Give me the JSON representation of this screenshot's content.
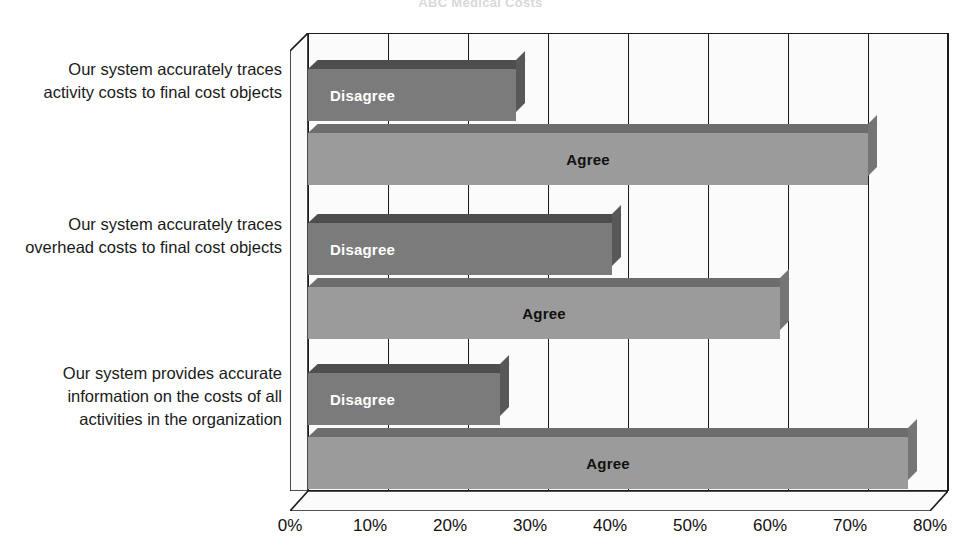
{
  "chart_data": {
    "type": "bar",
    "orientation": "horizontal",
    "title": "ABC Medical Costs",
    "xlabel": "",
    "ylabel": "",
    "xlim": [
      0,
      80
    ],
    "xticks": [
      "0%",
      "10%",
      "20%",
      "30%",
      "40%",
      "50%",
      "60%",
      "70%",
      "80%"
    ],
    "xtick_values": [
      0,
      10,
      20,
      30,
      40,
      50,
      60,
      70,
      80
    ],
    "grid": true,
    "legend": "inline-bar-labels",
    "categories": [
      "Our system accurately traces activity costs to final cost objects",
      "Our system accurately traces overhead costs to final cost objects",
      "Our system provides accurate information on the costs of all activities in the organization"
    ],
    "series": [
      {
        "name": "Disagree",
        "values": [
          26,
          38,
          24
        ],
        "color": "#7b7b7b"
      },
      {
        "name": "Agree",
        "values": [
          70,
          59,
          75
        ],
        "color": "#9b9b9b"
      }
    ]
  },
  "axis": {
    "ticks": [
      {
        "label": "0%",
        "value": 0
      },
      {
        "label": "10%",
        "value": 10
      },
      {
        "label": "20%",
        "value": 20
      },
      {
        "label": "30%",
        "value": 30
      },
      {
        "label": "40%",
        "value": 40
      },
      {
        "label": "50%",
        "value": 50
      },
      {
        "label": "60%",
        "value": 60
      },
      {
        "label": "70%",
        "value": 70
      },
      {
        "label": "80%",
        "value": 80
      }
    ]
  },
  "groups": [
    {
      "label": "Our system accurately traces activity costs to final cost objects",
      "bars": [
        {
          "series": "Disagree",
          "label": "Disagree",
          "value": 26
        },
        {
          "series": "Agree",
          "label": "Agree",
          "value": 70
        }
      ]
    },
    {
      "label": "Our system accurately traces overhead costs to final cost objects",
      "bars": [
        {
          "series": "Disagree",
          "label": "Disagree",
          "value": 38
        },
        {
          "series": "Agree",
          "label": "Agree",
          "value": 59
        }
      ]
    },
    {
      "label": "Our system provides accurate information on the costs of all activities in the organization",
      "bars": [
        {
          "series": "Disagree",
          "label": "Disagree",
          "value": 24
        },
        {
          "series": "Agree",
          "label": "Agree",
          "value": 75
        }
      ]
    }
  ],
  "colors": {
    "disagree": "#7b7b7b",
    "agree": "#9b9b9b",
    "axis": "#1b1b1b",
    "plot_background": "#fbfbfb",
    "page_background": "#ffffff"
  }
}
